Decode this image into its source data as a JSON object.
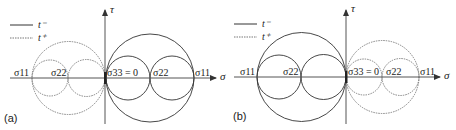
{
  "figure": {
    "colors": {
      "solid": "#333333",
      "dotted": "#777777",
      "axis": "#555555",
      "text": "#222222"
    },
    "legend": {
      "solid_label": "t⁻",
      "dotted_label": "t⁺"
    },
    "axes": {
      "x_label": "σ",
      "y_label": "τ"
    },
    "panels": [
      {
        "id": "a",
        "label": "(a)",
        "labels": {
          "s11_left": "σ11",
          "s22_left": "σ22",
          "s33": "σ33 = 0",
          "s22_right": "σ22",
          "s11_right": "σ11"
        },
        "solid_side": "right",
        "dotted_side": "left"
      },
      {
        "id": "b",
        "label": "(b)",
        "labels": {
          "s11_left": "σ11",
          "s22_left": "σ22",
          "s33": "σ33 = 0",
          "s22_right": "σ22",
          "s11_right": "σ11"
        },
        "solid_side": "left",
        "dotted_side": "right"
      }
    ]
  }
}
